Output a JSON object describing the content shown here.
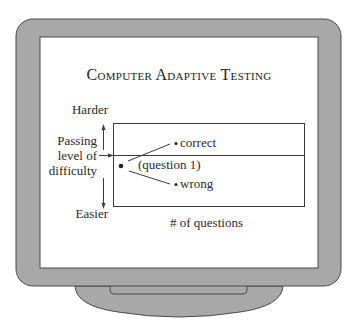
{
  "diagram": {
    "title": "Computer Adaptive Testing",
    "y_axis": {
      "top_label": "Harder",
      "bottom_label": "Easier",
      "marker_label_lines": [
        "Passing",
        "level of",
        "difficulty"
      ]
    },
    "x_axis": {
      "label": "# of questions"
    },
    "start_point_label": "(question 1)",
    "branches": [
      {
        "label": "correct",
        "direction": "up"
      },
      {
        "label": "wrong",
        "direction": "down"
      }
    ]
  },
  "colors": {
    "monitor_bezel": "#a8a8a8",
    "monitor_outline": "#4a4a4a",
    "screen": "#ffffff",
    "ink": "#2a2a2a"
  }
}
